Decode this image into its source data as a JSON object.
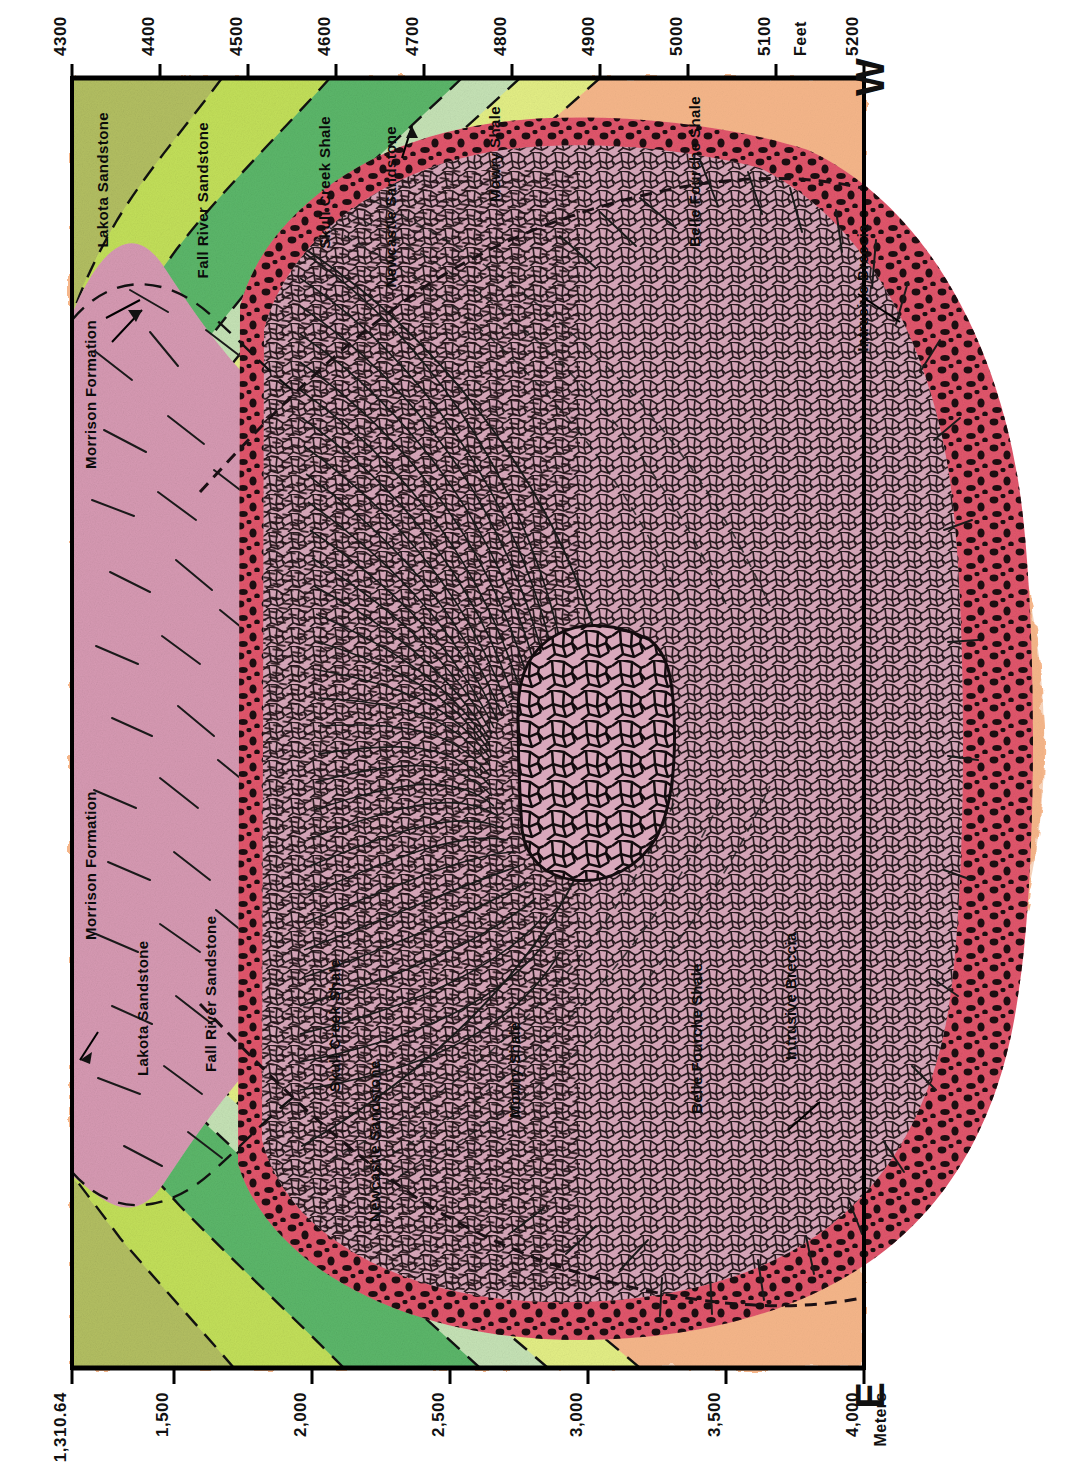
{
  "figure": {
    "type": "geologic-cross-section",
    "orientation": "rotated-90-clockwise",
    "title_visible": false
  },
  "compass": {
    "west": "W",
    "east": "E"
  },
  "axes": {
    "top": {
      "unit_label": "Feet",
      "ticks": [
        "4300",
        "4400",
        "4500",
        "4600",
        "4700",
        "4800",
        "4900",
        "5000",
        "5100",
        "5200"
      ]
    },
    "bottom": {
      "unit_label": "Meters",
      "ticks": [
        "1,310.64",
        "1,500",
        "2,000",
        "2,500",
        "3,000",
        "3,500",
        "4,000"
      ]
    }
  },
  "units": [
    {
      "name": "Lakota Sandstone",
      "color": "#b3bf62"
    },
    {
      "name": "Fall River Sandstone",
      "color": "#c3e05a"
    },
    {
      "name": "Skull Creek Shale",
      "color": "#5cb76a"
    },
    {
      "name": "Newcastle Sandstone",
      "color": "#c6e3b6"
    },
    {
      "name": "Mowry Shale",
      "color": "#e4ef86"
    },
    {
      "name": "Belle Fourche Shale",
      "color": "#f5b68a"
    },
    {
      "name": "Morrison Formation",
      "color": "#d79ab3"
    },
    {
      "name": "Intrusive Breccia",
      "color": "#e2566c"
    }
  ],
  "labels": {
    "top_units": [
      "Lakota Sandstone",
      "Fall River Sandstone",
      "Skull Creek Shale",
      "Newcastle Sandstone",
      "Mowry Shale",
      "Belle Fourche Shale"
    ],
    "bottom_units": [
      "Lakota Sandstone",
      "Fall River Sandstone",
      "Skull Creek Shale",
      "Newcastle Sandstone",
      "Mowry Shale",
      "Belle Fourche Shale"
    ],
    "morrison_top": "Morrison Formation",
    "morrison_bottom": "Morrison Formation",
    "breccia_top": "Intrusive Breccia",
    "breccia_bottom": "Intrusive Breccia"
  },
  "colors": {
    "lakota": "#b3bf62",
    "fall_river": "#c3e05a",
    "skull_creek": "#5cb76a",
    "newcastle": "#c6e3b6",
    "mowry": "#e4ef86",
    "belle_fourche": "#f5b68a",
    "morrison": "#d79ab3",
    "breccia_rim": "#e2566c",
    "intrusive_core": "#d9a8bb",
    "ink": "#111111"
  }
}
